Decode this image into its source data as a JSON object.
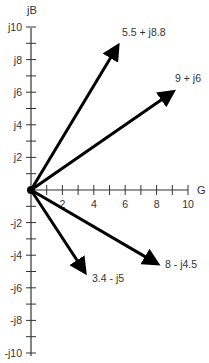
{
  "diagram": {
    "type": "complex-plane-phasor",
    "x_axis": {
      "label": "G",
      "min": 0,
      "max": 10,
      "ticks": [
        1,
        2,
        3,
        4,
        5,
        6,
        7,
        8,
        9,
        10
      ],
      "tick_labels": [
        "2",
        "4",
        "6",
        "8",
        "10"
      ],
      "tick_label_values": [
        2,
        4,
        6,
        8,
        10
      ]
    },
    "y_axis": {
      "label": "jB",
      "min": -10,
      "max": 10,
      "ticks": [
        -10,
        -9,
        -8,
        -7,
        -6,
        -5,
        -4,
        -3,
        -2,
        -1,
        1,
        2,
        3,
        4,
        5,
        6,
        7,
        8,
        9,
        10
      ],
      "tick_labels": [
        "j10",
        "j8",
        "j6",
        "j4",
        "j2",
        "-j2",
        "-j4",
        "-j6",
        "-j8",
        "-j10"
      ],
      "tick_label_values": [
        10,
        8,
        6,
        4,
        2,
        -2,
        -4,
        -6,
        -8,
        -10
      ]
    },
    "vectors": [
      {
        "label": "5.5 + j8.8",
        "re": 5.5,
        "im": 8.8
      },
      {
        "label": "9 + j6",
        "re": 9,
        "im": 6
      },
      {
        "label": "8 - j4.5",
        "re": 8,
        "im": -4.5
      },
      {
        "label": "3.4 - j5",
        "re": 3.4,
        "im": -5
      }
    ],
    "colors": {
      "axis": "#333333",
      "vector": "#000000",
      "text": "#333333"
    }
  }
}
